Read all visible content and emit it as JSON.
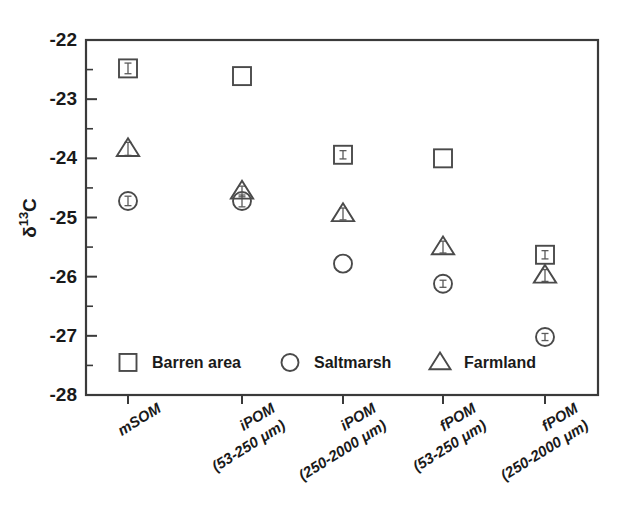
{
  "chart_data": {
    "type": "scatter",
    "title": "",
    "xlabel": "",
    "ylabel": "δ¹³C",
    "ylabel_parts": {
      "delta": "δ",
      "superscript": "13",
      "element": "C"
    },
    "categories": [
      {
        "line1": "mSOM",
        "line2": ""
      },
      {
        "line1": "iPOM",
        "line2": "(53-250 μm)"
      },
      {
        "line1": "iPOM",
        "line2": "(250-2000 μm)"
      },
      {
        "line1": "fPOM",
        "line2": "(53-250 μm)"
      },
      {
        "line1": "fPOM",
        "line2": "(250-2000 μm)"
      }
    ],
    "ylim": [
      -28,
      -22
    ],
    "ytick_labels": [
      "-22",
      "-23",
      "-24",
      "-25",
      "-26",
      "-27",
      "-28"
    ],
    "ytick_values": [
      -22,
      -23,
      -24,
      -25,
      -26,
      -27,
      -28
    ],
    "yminor_values": [
      -22.5,
      -23.5,
      -24.5,
      -25.5,
      -26.5,
      -27.5
    ],
    "grid": false,
    "legend_position": "inside-bottom-left",
    "series": [
      {
        "name": "Barren area",
        "marker": "square",
        "values": [
          -22.48,
          -22.61,
          -23.94,
          -24.0,
          -25.63
        ],
        "errors": [
          0.09,
          0.0,
          0.07,
          0.0,
          0.07
        ]
      },
      {
        "name": "Saltmarsh",
        "marker": "circle",
        "values": [
          -24.72,
          -24.72,
          -25.78,
          -26.12,
          -27.02
        ],
        "errors": [
          0.08,
          0.1,
          0.0,
          0.06,
          0.06
        ]
      },
      {
        "name": "Farmland",
        "marker": "triangle",
        "values": [
          -23.84,
          -24.56,
          -24.94,
          -25.5,
          -25.98
        ],
        "errors": [
          0.11,
          0.09,
          0.1,
          0.1,
          0.1
        ]
      }
    ]
  },
  "legend": {
    "entries": [
      {
        "label": "Barren area",
        "marker": "square"
      },
      {
        "label": "Saltmarsh",
        "marker": "circle"
      },
      {
        "label": "Farmland",
        "marker": "triangle"
      }
    ]
  },
  "colors": {
    "axis": "#3a3a3a",
    "marker": "#4a4a4a",
    "text": "#1a1a1a",
    "background": "#ffffff"
  }
}
